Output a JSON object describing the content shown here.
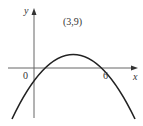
{
  "diagram": {
    "type": "parabola-graph",
    "axes": {
      "x_label": "x",
      "y_label": "y",
      "origin_label": "0"
    },
    "points": {
      "vertex_label": "(3,9)",
      "root_label": "6"
    },
    "curve": {
      "equation": "y = -(x-3)^2 + 9",
      "roots": [
        0,
        6
      ],
      "vertex": [
        3,
        9
      ]
    },
    "colors": {
      "curve": "#222222",
      "axes": "#555555",
      "background": "#ffffff"
    }
  }
}
